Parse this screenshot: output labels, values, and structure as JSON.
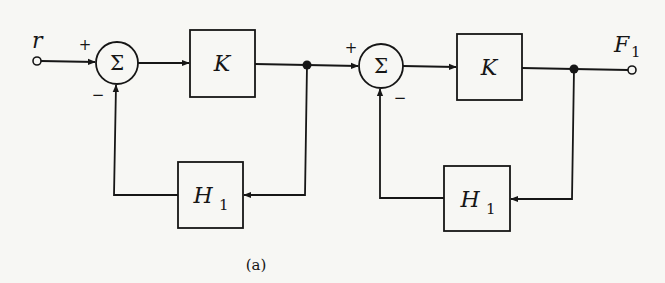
{
  "diagram": {
    "type": "block-diagram",
    "caption": "(a)",
    "input": {
      "label": "r"
    },
    "output": {
      "label": "F",
      "subscript": "1"
    },
    "summing_junctions": [
      {
        "id": "sum1",
        "symbol": "Σ",
        "plus_sign": "+",
        "minus_sign": "−"
      },
      {
        "id": "sum2",
        "symbol": "Σ",
        "plus_sign": "+",
        "minus_sign": "−"
      }
    ],
    "forward_blocks": [
      {
        "id": "k1",
        "label": "K"
      },
      {
        "id": "k2",
        "label": "K"
      }
    ],
    "feedback_blocks": [
      {
        "id": "h1a",
        "label": "H",
        "subscript": "1"
      },
      {
        "id": "h1b",
        "label": "H",
        "subscript": "1"
      }
    ],
    "connections": [
      "r → sum1 (+)",
      "sum1 → K",
      "K → node1",
      "node1 → H1 → sum1 (−)",
      "node1 → sum2 (+)",
      "sum2 → K",
      "K → node2",
      "node2 → H1 → sum2 (−)",
      "node2 → F1"
    ]
  }
}
